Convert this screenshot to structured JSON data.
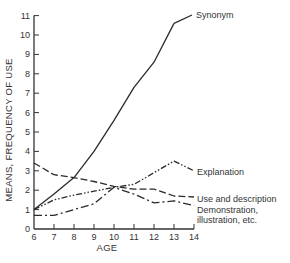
{
  "chart_data": {
    "type": "line",
    "title": "",
    "xlabel": "AGE",
    "ylabel": "MEANS, FREQUENCY OF USE",
    "x": [
      6,
      7,
      8,
      9,
      10,
      11,
      12,
      13,
      14
    ],
    "xlim": [
      6,
      14
    ],
    "ylim": [
      0,
      11
    ],
    "x_ticks": [
      "6",
      "7",
      "8",
      "9",
      "10",
      "11",
      "12",
      "13",
      "14"
    ],
    "y_ticks": [
      "0",
      "1",
      "2",
      "3",
      "4",
      "5",
      "6",
      "7",
      "8",
      "9",
      "10",
      "11"
    ],
    "grid": false,
    "legend_position": "inline labels at right end of each line",
    "series": [
      {
        "name": "Synonym",
        "line_style": "solid",
        "values": [
          1.0,
          1.8,
          2.65,
          4.0,
          5.6,
          7.3,
          8.6,
          10.6,
          null
        ]
      },
      {
        "name": "Explanation",
        "line_style": "dash-dot-dot",
        "values": [
          1.0,
          1.5,
          1.75,
          1.95,
          2.15,
          2.3,
          2.9,
          3.5,
          3.0
        ]
      },
      {
        "name": "Use and description",
        "line_style": "dashed",
        "values": [
          3.4,
          2.8,
          2.65,
          2.45,
          2.2,
          2.05,
          2.05,
          1.7,
          1.65
        ]
      },
      {
        "name": "Demonstration, illustration, etc.",
        "line_style": "dash-dot",
        "values": [
          0.7,
          0.7,
          1.0,
          1.3,
          2.15,
          1.8,
          1.35,
          1.45,
          1.2
        ]
      }
    ],
    "annotations": [
      {
        "text": "Synonym",
        "series": 0
      },
      {
        "text": "Explanation",
        "series": 1
      },
      {
        "text": "Use and description",
        "series": 2
      },
      {
        "text": "Demonstration,",
        "series": 3
      },
      {
        "text": "illustration, etc.",
        "series": 3
      }
    ]
  },
  "labels": {
    "synonym": "Synonym",
    "explanation": "Explanation",
    "use_description": "Use and description",
    "demonstration_line1": "Demonstration,",
    "demonstration_line2": "illustration, etc.",
    "xlabel": "AGE",
    "ylabel": "MEANS, FREQUENCY OF USE"
  },
  "style": {
    "line_color": "#2a2a2a",
    "axis_color": "#333333",
    "background": "#ffffff"
  }
}
